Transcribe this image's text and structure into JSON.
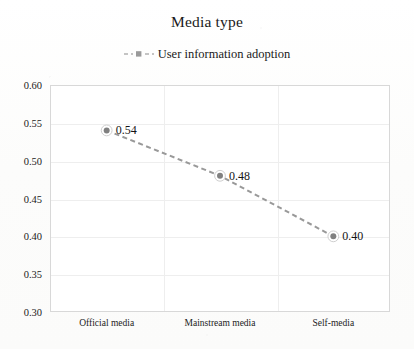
{
  "chart_data": {
    "type": "line",
    "title": "Media type",
    "xlabel": "",
    "ylabel": "",
    "categories": [
      "Official media",
      "Mainstream media",
      "Self-media"
    ],
    "series": [
      {
        "name": "User information adoption",
        "values": [
          0.54,
          0.48,
          0.4
        ],
        "point_labels": [
          "0.54",
          "0.48",
          "0.40"
        ],
        "line_style": "dashed",
        "line_color": "#999999",
        "marker": "circle",
        "marker_color": "#808080"
      }
    ],
    "ylim": [
      0.3,
      0.6
    ],
    "ytick_labels": [
      "0.60",
      "0.55",
      "0.50",
      "0.45",
      "0.40",
      "0.35",
      "0.30"
    ],
    "ytick_values": [
      0.6,
      0.55,
      0.5,
      0.45,
      0.4,
      0.35,
      0.3
    ],
    "grid": true,
    "legend_position": "top-center"
  },
  "legend": {
    "entries": [
      {
        "label": "User information adoption",
        "marker": "dashed-line-square-marker"
      }
    ]
  },
  "colors": {
    "line": "#999999",
    "marker": "#808080",
    "grid": "#eeeeee",
    "frame": "#d8d8d8",
    "text": "#1a1a1a"
  }
}
